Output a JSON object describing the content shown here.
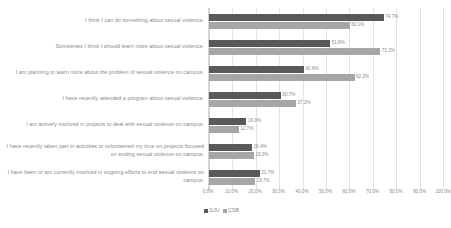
{
  "chart_data": {
    "type": "bar",
    "orientation": "horizontal",
    "title": "",
    "xlabel": "",
    "ylabel": "",
    "xlim": [
      0,
      100
    ],
    "grid": true,
    "legend_position": "bottom",
    "tick_labels": [
      "0.0%",
      "10.0%",
      "20.0%",
      "30.0%",
      "40.0%",
      "50.0%",
      "60.0%",
      "70.0%",
      "80.0%",
      "90.0%",
      "100.0%"
    ],
    "tick_values": [
      0,
      10,
      20,
      30,
      40,
      50,
      60,
      70,
      80,
      90,
      100
    ],
    "categories": [
      "I think I can do something about sexual violence.",
      "Sometimes I think I should learn more about sexual violence.",
      "I am planning to learn more about the problem of sexual violence on campus.",
      "I have recently attended a program about sexual violence.",
      "I am actively involved in projects to deal with sexual violence on campus.",
      "I have recently taken part in activities or volunteered my time on projects focused on ending sexual violence on campus.",
      "I have been or am currently involved in ongoing efforts to end sexual violence on campus."
    ],
    "series": [
      {
        "name": "SJU",
        "color": "#595959",
        "values": [
          74.7,
          51.8,
          40.6,
          30.7,
          16.0,
          18.4,
          21.7
        ],
        "labels": [
          "74.7%",
          "51.8%",
          "40.6%",
          "30.7%",
          "16.0%",
          "18.4%",
          "21.7%"
        ]
      },
      {
        "name": "CSB",
        "color": "#a6a6a6",
        "values": [
          60.1,
          73.2,
          62.2,
          37.2,
          12.7,
          19.2,
          19.7
        ],
        "labels": [
          "60.1%",
          "73.2%",
          "62.2%",
          "37.2%",
          "12.7%",
          "19.2%",
          "19.7%"
        ]
      }
    ]
  }
}
